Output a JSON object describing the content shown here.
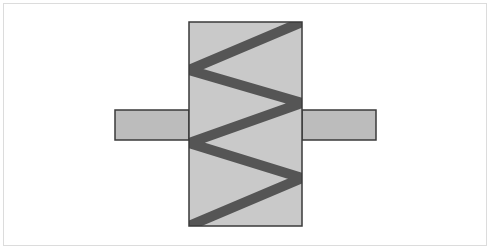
{
  "diagram": {
    "type": "spring-element-symbol",
    "colors": {
      "background": "#ffffff",
      "frame": "#dcdcdc",
      "body_fill": "#c9c9c9",
      "tab_fill": "#bcbcbc",
      "outline": "#3a3a3a",
      "zigzag": "#555555"
    },
    "body": {
      "x": 189,
      "y": 22,
      "width": 113,
      "height": 204
    },
    "left_tab": {
      "x": 115,
      "y": 110,
      "width": 74,
      "height": 30
    },
    "right_tab": {
      "x": 302,
      "y": 110,
      "width": 74,
      "height": 30
    },
    "zigzag_points": "302,22 189,70 302,103 189,143 302,178 189,226",
    "zigzag_width": 10
  }
}
